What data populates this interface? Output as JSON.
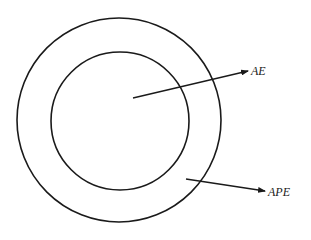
{
  "diagram": {
    "type": "concentric-circles",
    "stroke_color": "#1a1a1a",
    "background": "#ffffff",
    "outer_circle": {
      "cx": 119,
      "cy": 120,
      "r": 102
    },
    "inner_circle": {
      "cx": 120,
      "cy": 121,
      "r": 69
    },
    "arrows": [
      {
        "id": "ae",
        "from": [
          133,
          98
        ],
        "to": [
          248,
          71
        ],
        "label": "AE"
      },
      {
        "id": "ape",
        "from": [
          186,
          179
        ],
        "to": [
          265,
          191
        ],
        "label": "APE"
      }
    ]
  },
  "labels": {
    "ae": "AE",
    "ape": "APE"
  }
}
